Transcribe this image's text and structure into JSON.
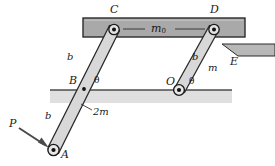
{
  "figure": {
    "colors": {
      "bar_fill": "#a9a9a9",
      "bar_stroke": "#2b2b2b",
      "link_fill": "#d6d6d6",
      "link_stroke": "#2b2b2b",
      "ground_line": "#555555",
      "ground_shade": "#cfcfcf",
      "wedge_fill": "#b3b3b3",
      "label_color": "#1a1a1a",
      "arrow_color": "#4a4a4a"
    }
  },
  "labels": {
    "pivot_c": "C",
    "pivot_d": "D",
    "bar_mass": "m",
    "bar_mass_sub": "0",
    "link_length_upper_left": "b",
    "link_length_upper_right": "b",
    "link_length_lower_left": "b",
    "link_mass_right": "m",
    "link_mass_left": "2m",
    "pivot_b": "B",
    "pivot_o": "O",
    "angle_left": "θ",
    "angle_right": "θ",
    "force_p": "P",
    "pivot_a": "A",
    "support_e": "E"
  },
  "elements": {
    "horizontal_bar": "m0-bar",
    "left_link": "link-A-B-C",
    "right_link": "link-O-D",
    "ground": "ground-line",
    "force_arrow": "applied-force-P",
    "wedge_support": "support-E",
    "centerline": "bar-centerline"
  }
}
